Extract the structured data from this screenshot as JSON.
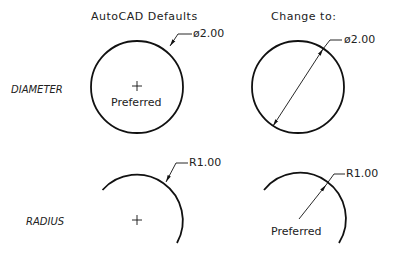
{
  "columns": {
    "left_heading": "AutoCAD Defaults",
    "right_heading": "Change to:"
  },
  "rows": {
    "diameter_label": "DIAMETER",
    "radius_label": "RADIUS"
  },
  "diameter": {
    "default": {
      "dimension_text": "ø2.00",
      "note": "Preferred"
    },
    "change": {
      "dimension_text": "ø2.00"
    }
  },
  "radius": {
    "default": {
      "dimension_text": "R1.00"
    },
    "change": {
      "dimension_text": "R1.00",
      "note": "Preferred"
    }
  },
  "colors": {
    "line": "#111111",
    "background": "#ffffff"
  }
}
